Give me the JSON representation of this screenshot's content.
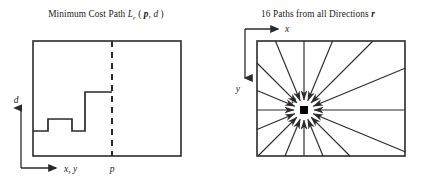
{
  "figure": {
    "panels": [
      {
        "id": "minimum-cost-path",
        "title_parts": {
          "lead": "Minimum Cost Path ",
          "symbol": "L",
          "subscript": "r",
          "args": " ( ",
          "arg1": "p",
          "comma": ", ",
          "arg2": "d",
          "close": " )"
        },
        "title_plain": "Minimum Cost Path L_r ( p, d )",
        "axes": {
          "y_label": "d",
          "x_label": "x, y"
        },
        "markers": [
          {
            "name": "p",
            "label": "p",
            "style": "dashed-vertical-line"
          }
        ],
        "box": {
          "x": 33,
          "y": 41,
          "width": 148,
          "height": 115
        },
        "dashed_line_x": 112,
        "step_path": [
          {
            "x": 33,
            "y": 131
          },
          {
            "x": 48,
            "y": 131
          },
          {
            "x": 48,
            "y": 119
          },
          {
            "x": 72,
            "y": 119
          },
          {
            "x": 72,
            "y": 131
          },
          {
            "x": 85,
            "y": 131
          },
          {
            "x": 85,
            "y": 92
          },
          {
            "x": 112,
            "y": 92
          }
        ]
      },
      {
        "id": "sixteen-paths",
        "title_parts": {
          "lead": "16 Paths from all Directions ",
          "symbol": "r"
        },
        "title_plain": "16 Paths from all Directions r",
        "axes": {
          "x_label": "x",
          "y_label": "y"
        },
        "markers": [
          {
            "name": "p",
            "label": "p",
            "style": "filled-square"
          }
        ],
        "box": {
          "x": 45,
          "y": 41,
          "width": 148,
          "height": 115
        },
        "center": {
          "x": 92,
          "y": 110
        },
        "path_count": 16,
        "direction_angles_deg": [
          0,
          22.5,
          45,
          67.5,
          90,
          112.5,
          135,
          157.5,
          180,
          202.5,
          225,
          247.5,
          270,
          292.5,
          315,
          337.5
        ]
      }
    ],
    "colors": {
      "stroke": "#2b2b2b",
      "text": "#1a1a1a",
      "background": "#ffffff"
    }
  }
}
